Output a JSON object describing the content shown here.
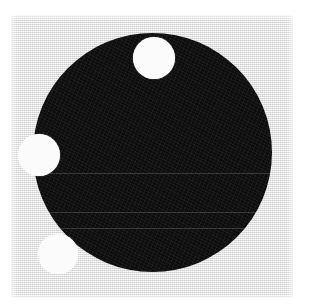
{
  "figure": {
    "canvas": {
      "width": 310,
      "height": 306,
      "background_color": "#ffffff"
    },
    "paper": {
      "label": "scanned paper background",
      "color": "#e9e9e9",
      "x": 11,
      "y": 15,
      "width": 282,
      "height": 283,
      "texture": "fine dithered halftone noise"
    },
    "primary_shape": {
      "label": "large black disc",
      "type": "circle",
      "color": "#0d0d0d",
      "center_x": 152,
      "center_y": 152,
      "radius": 119
    },
    "scan_lines": [
      {
        "label": "scan artifact line 1",
        "y": 173,
        "color": "#2a2a2a"
      },
      {
        "label": "scan artifact line 2",
        "y": 212,
        "color": "#2a2a2a"
      },
      {
        "label": "scan artifact line 3",
        "y": 228,
        "color": "#2a2a2a"
      }
    ],
    "white_dots": [
      {
        "label": "top white dot",
        "position": "inside disc, upper center-right",
        "color": "#fbfbfb",
        "center_x": 154,
        "center_y": 58,
        "radius": 21
      },
      {
        "label": "left white dot",
        "position": "straddling left edge of disc, mid height",
        "color": "#fbfbfb",
        "center_x": 39,
        "center_y": 155,
        "radius": 21
      },
      {
        "label": "bottom left white dot",
        "position": "straddling lower-left edge of disc",
        "color": "#fbfbfb",
        "center_x": 58,
        "center_y": 254,
        "radius": 20
      }
    ]
  }
}
